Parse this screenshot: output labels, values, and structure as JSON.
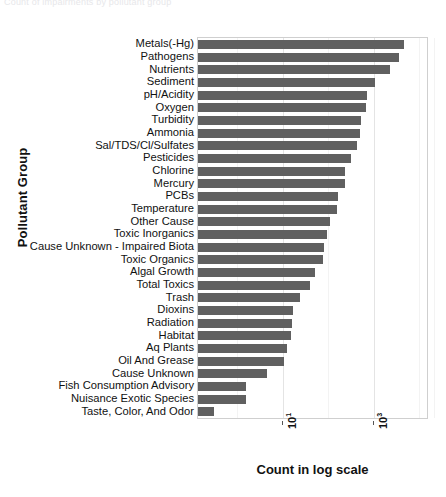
{
  "top_banner": {
    "text": "Count of impairments by pollutant group"
  },
  "axes": {
    "ylabel": "Pollutant Group",
    "xlabel": "Count in log scale",
    "xtick_labels": [
      "10",
      "10"
    ],
    "xtick_exponents": [
      "1",
      "3"
    ]
  },
  "chart_data": {
    "type": "bar",
    "orientation": "horizontal",
    "title": "",
    "xlabel": "Count in log scale",
    "ylabel": "Pollutant Group",
    "xscale": "log",
    "xlim": [
      1.6,
      10000
    ],
    "grid": true,
    "legend": "none",
    "bar_color": "#606060",
    "categories": [
      "Metals(-Hg)",
      "Pathogens",
      "Nutrients",
      "Sediment",
      "pH/Acidity",
      "Oxygen",
      "Turbidity",
      "Ammonia",
      "Sal/TDS/Cl/Sulfates",
      "Pesticides",
      "Chlorine",
      "Mercury",
      "PCBs",
      "Temperature",
      "Other Cause",
      "Toxic Inorganics",
      "Cause Unknown - Impaired Biota",
      "Toxic Organics",
      "Algal Growth",
      "Total Toxics",
      "Trash",
      "Dioxins",
      "Radiation",
      "Habitat",
      "Aq Plants",
      "Oil And Grease",
      "Cause Unknown",
      "Fish Consumption Advisory",
      "Nuisance Exotic Species",
      "Taste, Color, And Odor"
    ],
    "values": [
      4100,
      3500,
      2400,
      1400,
      1000,
      960,
      800,
      780,
      700,
      540,
      440,
      430,
      330,
      320,
      250,
      220,
      195,
      190,
      140,
      115,
      78,
      60,
      58,
      55,
      47,
      42,
      22,
      10,
      10,
      3
    ]
  }
}
